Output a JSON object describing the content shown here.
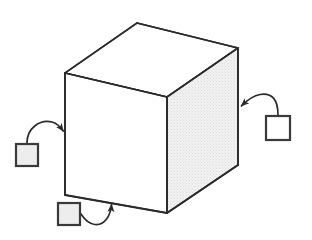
{
  "canvas": {
    "width": 312,
    "height": 240,
    "background_color": "#ffffff"
  },
  "figure": {
    "name": "cube-with-three-annotation-callouts",
    "description": "Line drawing of a 3D cube in oblique view with three small square callout markers connected by curved arrows pointing at the cube's left vertical edge, right vertical edge, and bottom front edge.",
    "stroke_color": "#2b2b2b",
    "stroke_width": 1.6
  },
  "cube": {
    "name": "cube",
    "front_face": {
      "name": "front-face",
      "fill_color": "#ffffff",
      "points": "65,73 167,97 167,213 65,195"
    },
    "top_face": {
      "name": "top-face",
      "fill_color": "#ffffff",
      "points": "65,73 137,23 238,48 167,97"
    },
    "right_face": {
      "name": "right-face",
      "fill_color": "#efefef",
      "texture": "stipple",
      "points": "167,97 238,48 238,165 167,213"
    },
    "vertices": {
      "front_top_left": [
        65,
        73
      ],
      "front_top_right": [
        167,
        97
      ],
      "front_bottom_right": [
        167,
        213
      ],
      "front_bottom_left": [
        65,
        195
      ],
      "back_top_left": [
        137,
        23
      ],
      "back_top_right": [
        238,
        48
      ],
      "back_bottom_right": [
        238,
        165
      ]
    }
  },
  "callouts": [
    {
      "id": "callout-left",
      "name": "callout-marker-left",
      "square": {
        "x": 16,
        "y": 144,
        "size": 22,
        "fill_color": "#ededed",
        "stroke_color": "#3a3a3a"
      },
      "arrow": {
        "name": "callout-arrow-left",
        "path": "M 27 143 C 27 128 40 119 52 122 C 59 124 61 128 63 131",
        "tip": [
          65,
          132
        ],
        "target": "cube front-left vertical edge",
        "direction": "right"
      }
    },
    {
      "id": "callout-right",
      "name": "callout-marker-right",
      "square": {
        "x": 266,
        "y": 116,
        "size": 24,
        "fill_color": "#ffffff",
        "stroke_color": "#3a3a3a"
      },
      "arrow": {
        "name": "callout-arrow-right",
        "path": "M 278 115 C 278 100 272 93 260 95 C 250 97 245 103 242 106",
        "tip": [
          239,
          107
        ],
        "target": "cube right vertical edge",
        "direction": "left"
      }
    },
    {
      "id": "callout-bottom",
      "name": "callout-marker-bottom",
      "square": {
        "x": 58,
        "y": 203,
        "size": 22,
        "fill_color": "#ededed",
        "stroke_color": "#3a3a3a"
      },
      "arrow": {
        "name": "callout-arrow-bottom",
        "path": "M 81 214 C 89 227 100 228 107 219 C 110 214 111 208 111 204",
        "tip": [
          112,
          201
        ],
        "target": "cube front bottom edge",
        "direction": "up"
      }
    }
  ]
}
